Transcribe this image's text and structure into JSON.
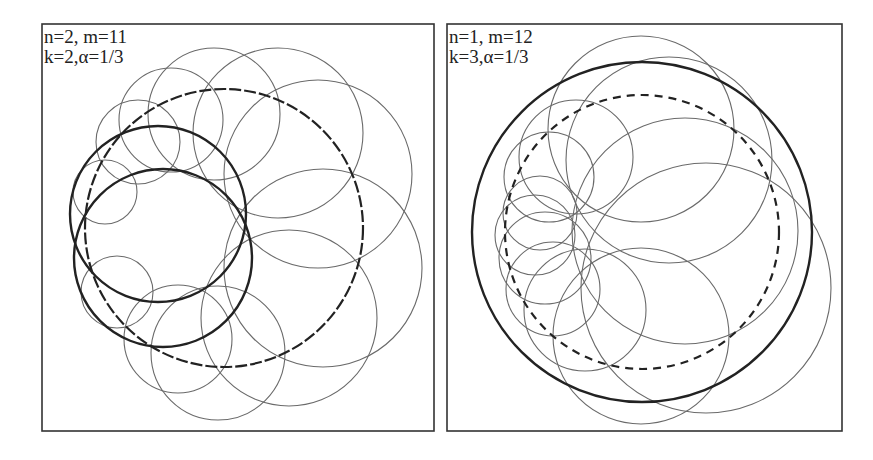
{
  "figure": {
    "panels": [
      {
        "id": "left",
        "frame": {
          "x": 42,
          "y": 24,
          "w": 392,
          "h": 407
        },
        "label_lines": [
          "n=2, m=11",
          "k=2,α=1/3"
        ],
        "params": {
          "n": 2,
          "m": 11,
          "k": 2,
          "alpha": "1/3"
        },
        "label_pos": {
          "x": 44,
          "y": 27
        },
        "dashed_circles": [
          {
            "cx": 224,
            "cy": 228,
            "r": 139,
            "dash": "12,3"
          }
        ],
        "thick_circles": [
          {
            "cx": 158,
            "cy": 214,
            "r": 88
          },
          {
            "cx": 163,
            "cy": 258,
            "r": 89
          }
        ],
        "thin_circles": [
          {
            "cx": 105,
            "cy": 192,
            "r": 32
          },
          {
            "cx": 138,
            "cy": 142,
            "r": 42
          },
          {
            "cx": 171,
            "cy": 120,
            "r": 52
          },
          {
            "cx": 214,
            "cy": 114,
            "r": 66
          },
          {
            "cx": 278,
            "cy": 133,
            "r": 85
          },
          {
            "cx": 318,
            "cy": 174,
            "r": 94
          },
          {
            "cx": 323,
            "cy": 268,
            "r": 99
          },
          {
            "cx": 289,
            "cy": 318,
            "r": 88
          },
          {
            "cx": 218,
            "cy": 353,
            "r": 67
          },
          {
            "cx": 178,
            "cy": 339,
            "r": 54
          },
          {
            "cx": 117,
            "cy": 292,
            "r": 36
          }
        ]
      },
      {
        "id": "right",
        "frame": {
          "x": 447,
          "y": 24,
          "w": 395,
          "h": 407
        },
        "label_lines": [
          "n=1, m=12",
          "k=3,α=1/3"
        ],
        "params": {
          "n": 1,
          "m": 12,
          "k": 3,
          "alpha": "1/3"
        },
        "label_pos": {
          "x": 449,
          "y": 27
        },
        "dashed_circles": [
          {
            "cx": 642,
            "cy": 232,
            "r": 137,
            "dash": "8,6"
          }
        ],
        "thick_circles": [
          {
            "cx": 642,
            "cy": 232,
            "r": 170
          }
        ],
        "thin_circles": [
          {
            "cx": 641,
            "cy": 129,
            "r": 93
          },
          {
            "cx": 669,
            "cy": 160,
            "r": 103
          },
          {
            "cx": 685,
            "cy": 231,
            "r": 113
          },
          {
            "cx": 706,
            "cy": 288,
            "r": 125
          },
          {
            "cx": 641,
            "cy": 336,
            "r": 88
          },
          {
            "cx": 585,
            "cy": 310,
            "r": 61
          },
          {
            "cx": 553,
            "cy": 289,
            "r": 47
          },
          {
            "cx": 545,
            "cy": 258,
            "r": 46
          },
          {
            "cx": 535,
            "cy": 235,
            "r": 40
          },
          {
            "cx": 540,
            "cy": 213,
            "r": 37
          },
          {
            "cx": 549,
            "cy": 177,
            "r": 45
          },
          {
            "cx": 576,
            "cy": 157,
            "r": 57
          }
        ]
      }
    ]
  }
}
